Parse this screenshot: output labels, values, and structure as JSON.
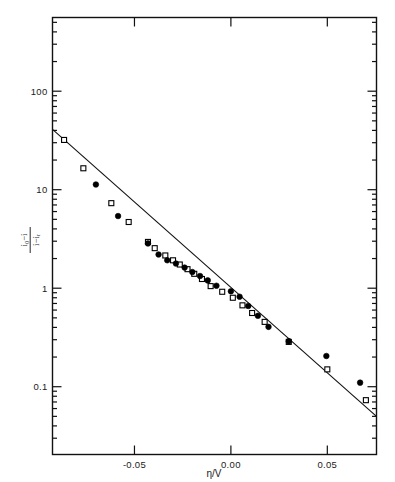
{
  "figure": {
    "background_color": "#ffffff",
    "ink_color": "#000000"
  },
  "chart_data": {
    "type": "scatter",
    "title": "",
    "xlabel": "η/V",
    "ylabel_numerator": "i₀−i",
    "ylabel_denominator": "i−iᵣ",
    "ylabel": "(i₀−i)/(i−iᵣ)",
    "yscale": "log",
    "xscale": "linear",
    "xlim": [
      -0.0925,
      0.0755
    ],
    "ylim": [
      0.0205,
      560
    ],
    "xticks": [
      -0.05,
      0.0,
      0.05
    ],
    "xtick_labels": [
      "-0.05",
      "0.00",
      "0.05"
    ],
    "yticks": [
      100,
      10,
      1,
      0.1
    ],
    "ytick_labels": [
      "100",
      "10",
      "1",
      "0.1"
    ],
    "grid": false,
    "legend_position": "none",
    "series": [
      {
        "name": "open-squares",
        "marker": "open-square",
        "marker_size": 5.0,
        "points": [
          {
            "x": -0.0865,
            "y": 32.0
          },
          {
            "x": -0.0765,
            "y": 16.5
          },
          {
            "x": -0.062,
            "y": 7.3
          },
          {
            "x": -0.053,
            "y": 4.7
          },
          {
            "x": -0.043,
            "y": 2.95
          },
          {
            "x": -0.0395,
            "y": 2.55
          },
          {
            "x": -0.034,
            "y": 2.15
          },
          {
            "x": -0.03,
            "y": 1.92
          },
          {
            "x": -0.0265,
            "y": 1.74
          },
          {
            "x": -0.0225,
            "y": 1.56
          },
          {
            "x": -0.019,
            "y": 1.4
          },
          {
            "x": -0.015,
            "y": 1.24
          },
          {
            "x": -0.0105,
            "y": 1.05
          },
          {
            "x": -0.0045,
            "y": 0.92
          },
          {
            "x": 0.001,
            "y": 0.8
          },
          {
            "x": 0.006,
            "y": 0.67
          },
          {
            "x": 0.011,
            "y": 0.56
          },
          {
            "x": 0.0175,
            "y": 0.455
          },
          {
            "x": 0.03,
            "y": 0.285
          },
          {
            "x": 0.05,
            "y": 0.15
          },
          {
            "x": 0.07,
            "y": 0.073
          }
        ]
      },
      {
        "name": "filled-circles",
        "marker": "filled-circle",
        "marker_size": 5.6,
        "points": [
          {
            "x": -0.07,
            "y": 11.3
          },
          {
            "x": -0.0585,
            "y": 5.4
          },
          {
            "x": -0.043,
            "y": 2.85
          },
          {
            "x": -0.0375,
            "y": 2.2
          },
          {
            "x": -0.033,
            "y": 1.92
          },
          {
            "x": -0.0285,
            "y": 1.78
          },
          {
            "x": -0.024,
            "y": 1.62
          },
          {
            "x": -0.02,
            "y": 1.46
          },
          {
            "x": -0.016,
            "y": 1.33
          },
          {
            "x": -0.012,
            "y": 1.2
          },
          {
            "x": -0.0075,
            "y": 1.06
          },
          {
            "x": 0.0,
            "y": 0.93
          },
          {
            "x": 0.0045,
            "y": 0.82
          },
          {
            "x": 0.009,
            "y": 0.66
          },
          {
            "x": 0.014,
            "y": 0.525
          },
          {
            "x": 0.0195,
            "y": 0.405
          },
          {
            "x": 0.03,
            "y": 0.29
          },
          {
            "x": 0.0495,
            "y": 0.205
          },
          {
            "x": 0.067,
            "y": 0.11
          }
        ]
      }
    ],
    "fit_line": {
      "name": "linear-fit",
      "x_start": -0.0925,
      "y_start": 41.0,
      "x_end": 0.0755,
      "y_end": 0.05
    },
    "annotations": []
  }
}
